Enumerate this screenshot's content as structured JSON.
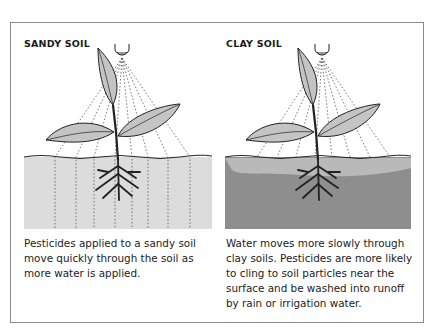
{
  "panels": [
    {
      "title": "SANDY SOIL",
      "caption": "Pesticides applied to a sandy soil move quickly through the soil as more water is applied.",
      "soil_color": "#dcdcdc",
      "soil_type": "sandy"
    },
    {
      "title": "CLAY SOIL",
      "caption": "Water moves more slowly through clay soils. Pesticides are more likely to cling to soil particles near the surface and be washed into runoff by rain or irrigation water.",
      "soil_color": "#8e8e8e",
      "surface_layer_color": "#b9b9b9",
      "soil_type": "clay"
    }
  ],
  "colors": {
    "frame": "#8a8a8a",
    "leaf": "#c4c4c4",
    "outline": "#222222"
  }
}
